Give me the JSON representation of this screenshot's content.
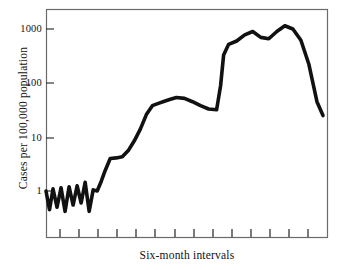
{
  "chart_data": {
    "type": "line",
    "title": "",
    "xlabel": "Six-month intervals",
    "ylabel": "Cases per 100,000 population",
    "yscale": "log",
    "ylim": [
      0.25,
      2000
    ],
    "grid": false,
    "legend": null,
    "ytick_labels": [
      "1000",
      "100",
      "10",
      "1"
    ],
    "ytick_values": [
      1000,
      100,
      10,
      1
    ],
    "xtick_labels": [
      "",
      "",
      "",
      "",
      "",
      "",
      "",
      "",
      "",
      "",
      "",
      "",
      "",
      ""
    ],
    "xtick_count": 14,
    "xlim": [
      0,
      28
    ],
    "series": [
      {
        "name": "Cases per 100,000 population",
        "x": [
          0,
          0.35,
          0.7,
          1.1,
          1.5,
          1.9,
          2.3,
          2.7,
          3.1,
          3.5,
          3.9,
          4.3,
          4.7,
          5.1,
          5.5,
          5.9,
          6.4,
          7.0,
          7.6,
          8.2,
          8.8,
          9.4,
          10.0,
          10.6,
          11.2,
          11.8,
          12.4,
          13.0,
          13.8,
          14.6,
          15.4,
          16.2,
          17.0,
          17.4,
          17.7,
          18.2,
          19.0,
          19.8,
          20.6,
          21.4,
          22.2,
          23.0,
          23.8,
          24.6,
          25.4,
          26.2,
          27.0,
          27.6
        ],
        "y": [
          1.0,
          0.45,
          1.1,
          0.5,
          1.15,
          0.42,
          1.2,
          0.55,
          1.25,
          0.6,
          1.45,
          0.42,
          1.05,
          1.0,
          1.5,
          2.4,
          4.0,
          4.1,
          4.3,
          5.6,
          8.5,
          14,
          26,
          38,
          42,
          46,
          50,
          54,
          52,
          45,
          38,
          33,
          32,
          90,
          330,
          520,
          600,
          780,
          900,
          700,
          660,
          900,
          1150,
          1000,
          620,
          220,
          45,
          25
        ]
      }
    ]
  },
  "axis": {
    "y_ticks": [
      {
        "label": "1000",
        "value": 1000
      },
      {
        "label": "100",
        "value": 100
      },
      {
        "label": "10",
        "value": 10
      },
      {
        "label": "1",
        "value": 1
      }
    ],
    "x_label": "Six-month intervals",
    "y_label": "Cases per 100,000 population"
  },
  "style": {
    "line_color": "#111111",
    "frame_color": "#5a5a5a",
    "background": "#ffffff"
  }
}
